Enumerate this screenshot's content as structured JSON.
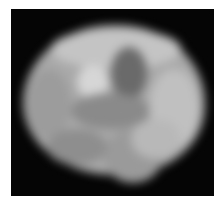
{
  "image": {
    "subject": "grayscale blurred image of a rounded celestial body with mottled surface",
    "background_color": "#050505",
    "page_color": "#ffffff",
    "features": [
      {
        "name": "main-disk",
        "description": "overall bright gray irregular disk"
      },
      {
        "name": "dark-patch-upper-center",
        "description": "dark region near top center"
      },
      {
        "name": "bright-spot-upper-left",
        "description": "bright spot left of dark patch"
      },
      {
        "name": "dark-band-middle",
        "description": "dimmer band across middle"
      },
      {
        "name": "bright-region-right",
        "description": "brighter area on right side"
      },
      {
        "name": "bottom-bulge",
        "description": "lobe extending downward at bottom center"
      }
    ]
  }
}
